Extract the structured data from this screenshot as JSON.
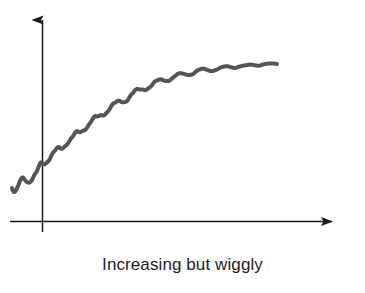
{
  "figure": {
    "caption": "Increasing but wiggly",
    "background_color": "#ffffff",
    "axis_color": "#1a1a1a",
    "curve_color": "#555555",
    "curve_width_px": 4
  },
  "chart_data": {
    "type": "line",
    "title": "Increasing but wiggly",
    "subtitle": "",
    "xlabel": "",
    "ylabel": "",
    "annotations": [
      "Increasing but wiggly"
    ],
    "legend": [],
    "legend_position": "none",
    "grid": false,
    "axes": {
      "show_x_axis": true,
      "show_y_axis": true,
      "x_arrow": "right",
      "y_arrow": "up",
      "x_tick_labels": [],
      "y_tick_labels": [],
      "origin_px": {
        "x": 42,
        "y": 222
      },
      "x_axis_px": {
        "from": 10,
        "to": 343,
        "y": 222
      },
      "y_axis_px": {
        "from": 232,
        "to": 8,
        "x": 42
      }
    },
    "series": [
      {
        "name": "wiggly increasing curve",
        "monotonic": "increasing",
        "concavity": "down",
        "wiggle_count": 13,
        "x": [
          12,
          18,
          24,
          30,
          36,
          42,
          48,
          54,
          60,
          66,
          72,
          78,
          84,
          90,
          96,
          102,
          108,
          114,
          120,
          126,
          132,
          138,
          144,
          150,
          156,
          162,
          168,
          174,
          180,
          186,
          192,
          198,
          204,
          210,
          216,
          222,
          228,
          234,
          240,
          246,
          252,
          258,
          264,
          270,
          277
        ],
        "y": [
          188,
          186,
          181,
          178,
          176,
          163,
          158,
          155,
          148,
          142,
          140,
          133,
          127,
          124,
          119,
          113,
          110,
          106,
          101,
          99,
          95,
          91,
          88,
          86,
          83,
          80,
          79,
          77,
          75,
          74,
          73,
          71,
          70,
          70,
          69,
          68,
          67,
          67,
          66,
          66,
          65,
          65,
          64,
          64,
          64
        ],
        "y_note": "pixel coordinates, origin top-left; smaller y = higher value"
      }
    ],
    "x_start_px": 12,
    "x_end_px": 277,
    "y_start_px": 188,
    "y_end_px": 64
  }
}
